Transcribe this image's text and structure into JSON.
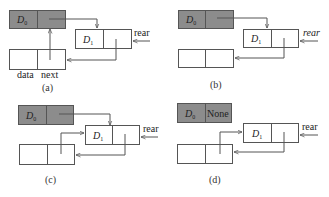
{
  "colors": {
    "head_node_fill": "#8c8c8c",
    "node_fill": "#ffffff",
    "stroke": "#555555"
  },
  "panels": [
    {
      "caption": "(a)",
      "head_node": {
        "data": "D0",
        "data_base": "D",
        "data_sub": "0",
        "next": ""
      },
      "node1": {
        "data": "D1",
        "data_base": "D",
        "data_sub": "1",
        "next": ""
      },
      "new_node": {
        "data": "",
        "next": ""
      },
      "pointer_label": "rear",
      "field_labels": {
        "data": "data",
        "next": "next"
      }
    },
    {
      "caption": "(b)",
      "head_node": {
        "data": "D0",
        "data_base": "D",
        "data_sub": "0",
        "next": ""
      },
      "node1": {
        "data": "D1",
        "data_base": "D",
        "data_sub": "1",
        "next": ""
      },
      "new_node": {
        "data": "",
        "next": ""
      },
      "pointer_label": "rear"
    },
    {
      "caption": "(c)",
      "head_node": {
        "data": "D0",
        "data_base": "D",
        "data_sub": "0",
        "next": ""
      },
      "node1": {
        "data": "D1",
        "data_base": "D",
        "data_sub": "1",
        "next": ""
      },
      "new_node": {
        "data": "",
        "next": ""
      },
      "pointer_label": "rear"
    },
    {
      "caption": "(d)",
      "head_node": {
        "data": "D0",
        "data_base": "D",
        "data_sub": "0",
        "next": "None"
      },
      "node1": {
        "data": "D1",
        "data_base": "D",
        "data_sub": "1",
        "next": ""
      },
      "new_node": {
        "data": "",
        "next": ""
      },
      "pointer_label": "rear"
    }
  ]
}
